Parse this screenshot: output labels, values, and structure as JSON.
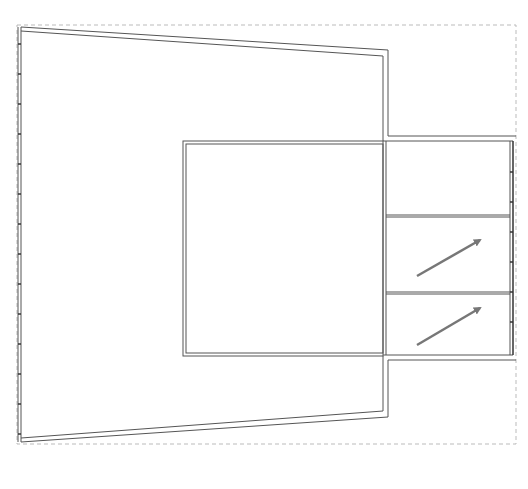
{
  "diagram": {
    "type": "floor-plan",
    "colors": {
      "background": "#ffffff",
      "wall_stroke": "#555555",
      "boundary_dash": "#bbbbbb",
      "arrow": "#777777"
    },
    "boundary": {
      "x1": 17,
      "y1": 25,
      "x2": 516,
      "y2": 444
    },
    "regions": [
      {
        "name": "trapezoid-room",
        "label": ""
      },
      {
        "name": "center-square-room",
        "label": ""
      },
      {
        "name": "right-panel-top",
        "label": ""
      },
      {
        "name": "right-panel-middle",
        "label": ""
      },
      {
        "name": "right-panel-bottom",
        "label": ""
      }
    ],
    "arrows": [
      {
        "name": "middle-panel-arrow",
        "from": [
          417,
          276
        ],
        "to": [
          480,
          240
        ]
      },
      {
        "name": "bottom-panel-arrow",
        "from": [
          417,
          345
        ],
        "to": [
          480,
          308
        ]
      }
    ]
  }
}
